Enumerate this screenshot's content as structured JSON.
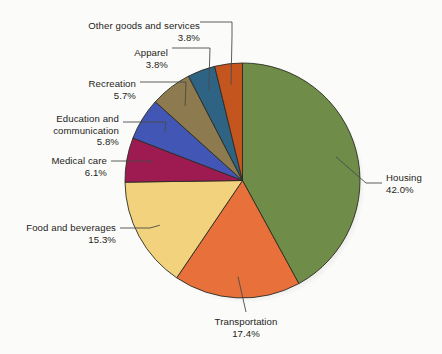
{
  "chart_data": {
    "type": "pie",
    "title": "",
    "subtitle": "",
    "xlabel": "",
    "ylabel": "",
    "legend_position": "none",
    "grid": false,
    "units": "percent",
    "start_angle_deg": 0,
    "direction": "clockwise",
    "categories": [
      "Housing",
      "Transportation",
      "Food and beverages",
      "Medical care",
      "Education and communication",
      "Recreation",
      "Apparel",
      "Other goods and services"
    ],
    "values": [
      42.0,
      17.4,
      15.3,
      6.1,
      5.8,
      5.7,
      3.8,
      3.8
    ],
    "value_labels": [
      "42.0%",
      "17.4%",
      "15.3%",
      "6.1%",
      "5.8%",
      "5.7%",
      "3.8%",
      "3.8%"
    ],
    "colors": [
      "#6f8c49",
      "#e8703a",
      "#f2d27c",
      "#9e1b52",
      "#4257b5",
      "#8d7a4e",
      "#2e6383",
      "#c4551f"
    ],
    "slices": [
      {
        "label": "Housing",
        "label_line2": "",
        "value": 42.0,
        "value_label": "42.0%",
        "color": "#6f8c49"
      },
      {
        "label": "Transportation",
        "label_line2": "",
        "value": 17.4,
        "value_label": "17.4%",
        "color": "#e8703a"
      },
      {
        "label": "Food and beverages",
        "label_line2": "",
        "value": 15.3,
        "value_label": "15.3%",
        "color": "#f2d27c"
      },
      {
        "label": "Medical care",
        "label_line2": "",
        "value": 6.1,
        "value_label": "6.1%",
        "color": "#9e1b52"
      },
      {
        "label": "Education and",
        "label_line2": "communication",
        "value": 5.8,
        "value_label": "5.8%",
        "color": "#4257b5"
      },
      {
        "label": "Recreation",
        "label_line2": "",
        "value": 5.7,
        "value_label": "5.7%",
        "color": "#8d7a4e"
      },
      {
        "label": "Apparel",
        "label_line2": "",
        "value": 3.8,
        "value_label": "3.8%",
        "color": "#2e6383"
      },
      {
        "label": "Other goods and services",
        "label_line2": "",
        "value": 3.8,
        "value_label": "3.8%",
        "color": "#c4551f"
      }
    ]
  },
  "style": {
    "background": "#fbfbf9",
    "text_color": "#1d1d1b",
    "slice_border": "#2b2b24",
    "leader_color": "#4a4a4a"
  }
}
